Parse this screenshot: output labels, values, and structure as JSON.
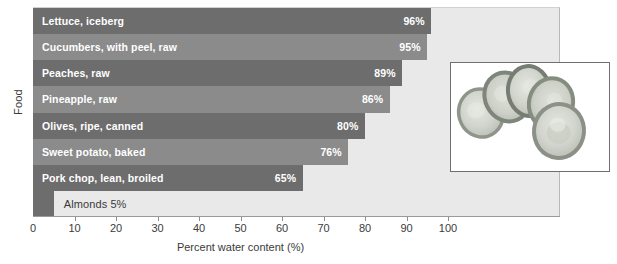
{
  "chart_data": {
    "type": "bar",
    "orientation": "horizontal",
    "title": "",
    "xlabel": "Percent water content (%)",
    "ylabel": "Food",
    "xlim": [
      0,
      100
    ],
    "xticks": [
      0,
      10,
      20,
      30,
      40,
      50,
      60,
      70,
      80,
      90,
      100
    ],
    "grid": false,
    "legend": null,
    "categories": [
      "Lettuce, iceberg",
      "Cucumbers, with peel, raw",
      "Peaches, raw",
      "Pineapple, raw",
      "Olives, ripe, canned",
      "Sweet potato, baked",
      "Pork chop, lean, broiled",
      "Almonds"
    ],
    "values": [
      96,
      95,
      89,
      86,
      80,
      76,
      65,
      5
    ],
    "value_labels": [
      "96%",
      "95%",
      "89%",
      "86%",
      "80%",
      "76%",
      "65%",
      "5%"
    ],
    "bars": [
      {
        "label": "Lettuce, iceberg",
        "value": 96,
        "value_label": "96%",
        "color": "#6d6d6d",
        "label_inside": true
      },
      {
        "label": "Cucumbers, with peel, raw",
        "value": 95,
        "value_label": "95%",
        "color": "#8b8b8b",
        "label_inside": true
      },
      {
        "label": "Peaches, raw",
        "value": 89,
        "value_label": "89%",
        "color": "#6d6d6d",
        "label_inside": true
      },
      {
        "label": "Pineapple, raw",
        "value": 86,
        "value_label": "86%",
        "color": "#8b8b8b",
        "label_inside": true
      },
      {
        "label": "Olives, ripe, canned",
        "value": 80,
        "value_label": "80%",
        "color": "#6d6d6d",
        "label_inside": true
      },
      {
        "label": "Sweet potato, baked",
        "value": 76,
        "value_label": "76%",
        "color": "#8b8b8b",
        "label_inside": true
      },
      {
        "label": "Pork chop, lean, broiled",
        "value": 65,
        "value_label": "65%",
        "color": "#6d6d6d",
        "label_inside": true
      },
      {
        "label": "Almonds 5%",
        "value": 5,
        "value_label": "5%",
        "color": "#6d6d6d",
        "label_inside": false
      }
    ]
  },
  "axes": {
    "y_title": "Food",
    "x_title": "Percent water content (%)",
    "x_tick_labels": [
      "0",
      "10",
      "20",
      "30",
      "40",
      "50",
      "60",
      "70",
      "80",
      "90",
      "100"
    ]
  },
  "inset": {
    "name": "cucumber-slices-photo",
    "description": "Photograph of sliced cucumber rounds"
  },
  "colors": {
    "bar_dark": "#6d6d6d",
    "bar_light": "#8b8b8b",
    "plot_background": "#e9e9e9",
    "page_background": "#ffffff",
    "text": "#3b3b3b",
    "bar_text": "#ffffff"
  }
}
